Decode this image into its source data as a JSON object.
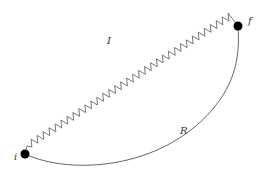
{
  "diagram": {
    "type": "path-diagram",
    "vertices": [
      {
        "id": "i",
        "label": "i",
        "x": 25,
        "y": 154
      },
      {
        "id": "f",
        "label": "f",
        "x": 238,
        "y": 26
      }
    ],
    "edges": [
      {
        "id": "I",
        "label": "I",
        "style": "zigzag",
        "from": "i",
        "to": "f"
      },
      {
        "id": "R",
        "label": "R",
        "style": "smooth-curve",
        "from": "i",
        "to": "f"
      }
    ],
    "colors": {
      "line": "#555555",
      "vertex": "#000000",
      "background": "#ffffff"
    }
  }
}
